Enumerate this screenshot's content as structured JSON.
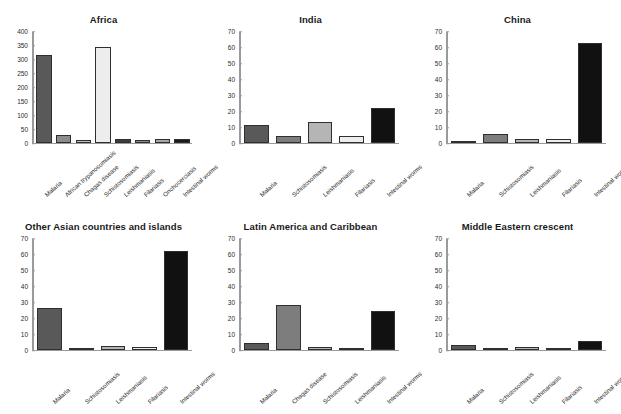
{
  "figure": {
    "width": 621,
    "height": 414,
    "background": "#ffffff",
    "panel_count": 6
  },
  "chart_data": [
    {
      "type": "bar",
      "title": "Africa",
      "xlabel": "",
      "ylabel": "",
      "ylim": [
        0,
        400
      ],
      "yticks": [
        0,
        50,
        100,
        150,
        200,
        250,
        300,
        350,
        400
      ],
      "grid": false,
      "legend": "none",
      "categories": [
        "Malaria",
        "African trypanosomiasis",
        "Chagas disease",
        "Schistosomiasis",
        "Leishmaniasis",
        "Filariasis",
        "Onchocerciasis",
        "Intestinal worms"
      ],
      "values": [
        315,
        27,
        8,
        345,
        11,
        9,
        11,
        13
      ],
      "bar_colors": [
        "#595959",
        "#8c8c8c",
        "#bfbfbf",
        "#ededed",
        "#3d3d3d",
        "#8c8c8c",
        "#a6a6a6",
        "#1a1a1a"
      ]
    },
    {
      "type": "bar",
      "title": "India",
      "xlabel": "",
      "ylabel": "",
      "ylim": [
        0,
        70
      ],
      "yticks": [
        0,
        10,
        20,
        30,
        40,
        50,
        60,
        70
      ],
      "grid": false,
      "legend": "none",
      "categories": [
        "Malaria",
        "Schistosomiasis",
        "Leishmaniasis",
        "Filariasis",
        "Intestinal worms"
      ],
      "values": [
        11,
        4,
        13,
        4,
        22
      ],
      "bar_colors": [
        "#595959",
        "#7d7d7d",
        "#b5b5b5",
        "#ededed",
        "#111111"
      ]
    },
    {
      "type": "bar",
      "title": "China",
      "xlabel": "",
      "ylabel": "",
      "ylim": [
        0,
        70
      ],
      "yticks": [
        0,
        10,
        20,
        30,
        40,
        50,
        60,
        70
      ],
      "grid": false,
      "legend": "none",
      "categories": [
        "Malaria",
        "Schistosomiasis",
        "Leishmaniasis",
        "Filariasis",
        "Intestinal worms"
      ],
      "values": [
        1.2,
        5.5,
        2,
        2,
        63
      ],
      "bar_colors": [
        "#595959",
        "#7d7d7d",
        "#b5b5b5",
        "#ededed",
        "#111111"
      ]
    },
    {
      "type": "bar",
      "title": "Other Asian countries and islands",
      "xlabel": "",
      "ylabel": "",
      "ylim": [
        0,
        70
      ],
      "yticks": [
        0,
        10,
        20,
        30,
        40,
        50,
        60,
        70
      ],
      "grid": false,
      "legend": "none",
      "categories": [
        "Malaria",
        "Schistosomiasis",
        "Leishmaniasis",
        "Filariasis",
        "Intestinal worms"
      ],
      "values": [
        26.5,
        1.2,
        2,
        1.5,
        62.5
      ],
      "bar_colors": [
        "#595959",
        "#7d7d7d",
        "#b5b5b5",
        "#ededed",
        "#111111"
      ]
    },
    {
      "type": "bar",
      "title": "Latin America and Caribbean",
      "xlabel": "",
      "ylabel": "",
      "ylim": [
        0,
        70
      ],
      "yticks": [
        0,
        10,
        20,
        30,
        40,
        50,
        60,
        70
      ],
      "grid": false,
      "legend": "none",
      "categories": [
        "Malaria",
        "Chagas disease",
        "Schistosomiasis",
        "Leishmaniasis",
        "Intestinal worms"
      ],
      "values": [
        4,
        28.5,
        1.5,
        1,
        24.5
      ],
      "bar_colors": [
        "#595959",
        "#7d7d7d",
        "#b5b5b5",
        "#ededed",
        "#111111"
      ]
    },
    {
      "type": "bar",
      "title": "Middle Eastern crescent",
      "xlabel": "",
      "ylabel": "",
      "ylim": [
        0,
        70
      ],
      "yticks": [
        0,
        10,
        20,
        30,
        40,
        50,
        60,
        70
      ],
      "grid": false,
      "legend": "none",
      "categories": [
        "Malaria",
        "Schistosomiasis",
        "Leishmaniasis",
        "Filariasis",
        "Intestinal worms"
      ],
      "values": [
        3,
        1,
        1.8,
        0.8,
        5.5
      ],
      "bar_colors": [
        "#595959",
        "#7d7d7d",
        "#b5b5b5",
        "#ededed",
        "#111111"
      ]
    }
  ]
}
